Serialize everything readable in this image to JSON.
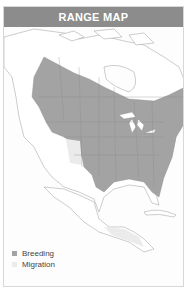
{
  "header": {
    "title": "RANGE MAP"
  },
  "map": {
    "region": "North America",
    "colors": {
      "breeding": "#a3a3a3",
      "migration": "#e9e9e9",
      "land": "#ffffff",
      "border": "#9a9a9a",
      "water": "#fdfdfd"
    }
  },
  "legend": {
    "items": [
      {
        "label": "Breeding",
        "color": "#a3a3a3"
      },
      {
        "label": "Migration",
        "color": "#ebebeb"
      }
    ]
  }
}
